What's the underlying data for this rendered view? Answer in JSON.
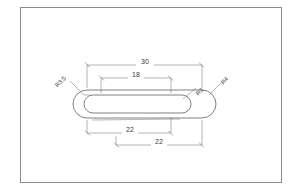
{
  "canvas": {
    "width": 298,
    "height": 196,
    "background": "#ffffff"
  },
  "frame": {
    "name": "drawing-border",
    "border_color": "#8c8c8c",
    "x": 20,
    "y": 7,
    "width": 262,
    "height": 176
  },
  "drawing": {
    "type": "2d-technical-drawing",
    "title": "",
    "line_color": "#4a4a4a",
    "dimension_color": "#6b6b6b",
    "text_color": "#3a3a3a",
    "units": "mm"
  },
  "dimensions": {
    "top": [
      {
        "id": "dim-30",
        "value": "30",
        "x1": 87,
        "x2": 202,
        "y": 65,
        "label_x": 144,
        "label_y": 63
      },
      {
        "id": "dim-18",
        "value": "18",
        "x1": 101,
        "x2": 171,
        "y": 78,
        "label_x": 136,
        "label_y": 76
      }
    ],
    "bottom": [
      {
        "id": "dim-22-upper",
        "value": "22",
        "x1": 87,
        "x2": 171,
        "y": 133,
        "label_x": 129,
        "label_y": 131
      },
      {
        "id": "dim-22-lower",
        "value": "22",
        "x1": 116,
        "x2": 202,
        "y": 145,
        "label_x": 159,
        "label_y": 143
      }
    ]
  },
  "radii": [
    {
      "id": "radius-r3-5",
      "value": "R3.5",
      "label_x": 64,
      "label_y": 84,
      "rotation": -45,
      "leader_x1": 73,
      "leader_y1": 88,
      "leader_x2": 83,
      "leader_y2": 96
    },
    {
      "id": "radius-r3",
      "value": "R3",
      "label_x": 193,
      "label_y": 92,
      "rotation": -45,
      "leader_x1": 190,
      "leader_y1": 96,
      "leader_x2": 180,
      "leader_y2": 101
    },
    {
      "id": "radius-r4",
      "value": "R4",
      "label_x": 219,
      "label_y": 85,
      "rotation": -45,
      "leader_x1": 217,
      "leader_y1": 89,
      "leader_x2": 209,
      "leader_y2": 96
    }
  ],
  "shapes": {
    "outer_slot": {
      "name": "outer-stadium-profile",
      "left_center_x": 87,
      "right_center_x": 202,
      "center_y": 104,
      "radius": 14
    },
    "inner_slot": {
      "name": "inner-stadium-profile",
      "left_center_x": 93,
      "right_center_x": 182,
      "center_y": 104,
      "radius": 9
    }
  }
}
